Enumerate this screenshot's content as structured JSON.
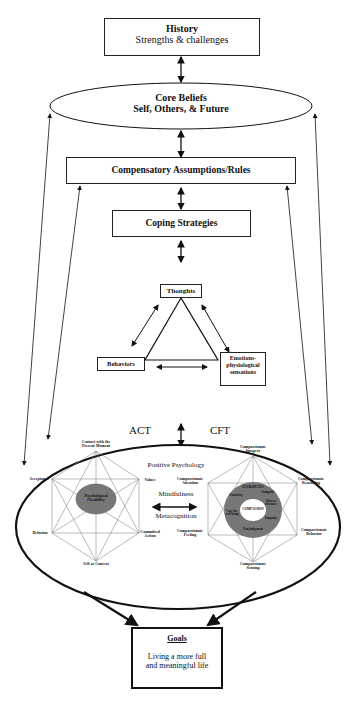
{
  "diagram": {
    "history": {
      "title": "History",
      "subtitle": "Strengths & challenges"
    },
    "core_beliefs": {
      "title": "Core Beliefs",
      "subtitle": "Self, Others, & Future"
    },
    "compensatory": {
      "title": "Compensatory Assumptions/Rules"
    },
    "coping": {
      "title": "Coping Strategies"
    },
    "triangle": {
      "thoughts": "Thoughts",
      "behaviors": "Behaviors",
      "emotions_line1": "Emotions-",
      "emotions_line2": "physiological",
      "emotions_line3": "sensations"
    },
    "center": {
      "act_title": "ACT",
      "cft_title": "CFT",
      "positive_psychology": "Positive Psychology",
      "mindfulness": "Mindfulness",
      "metacognition": "Metacognition"
    },
    "act_hexaflex": {
      "top": "Contact with the Present Moment",
      "right_top": "Values",
      "right_bottom_1": "Committed",
      "right_bottom_2": "Action",
      "bottom": "Self as Context",
      "left_bottom": "Defusion",
      "left_top": "Acceptance",
      "center_1": "Psychological",
      "center_2": "Flexibility"
    },
    "cft_hexagon": {
      "top_1": "Compassionate",
      "top_2": "Imagery",
      "right_top_1": "Compassionate",
      "right_top_2": "Reasoning",
      "right_bottom_1": "Compassionate",
      "right_bottom_2": "Behavior",
      "bottom_1": "Compassionate",
      "bottom_2": "Sensing",
      "left_bottom_1": "Compassionate",
      "left_bottom_2": "Feeling",
      "left_top_1": "Compassionate",
      "left_top_2": "Attention",
      "ring_title": "ATTRIBUTES",
      "ring_items": [
        "Sensitivity",
        "Sympathy",
        "Distress tolerance",
        "Empathy",
        "Non-judgement",
        "Care for well-being"
      ],
      "center": "COMPASSION"
    },
    "goals": {
      "title": "Goals",
      "line1": "Living a more full",
      "line2": "and meaningful life"
    }
  }
}
